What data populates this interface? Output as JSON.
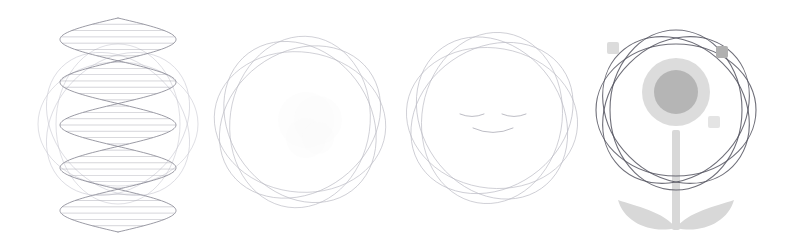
{
  "page": {
    "background_color": "#ffffff",
    "width": 785,
    "height": 248,
    "style": "minimal line-art, light gray strokes on white"
  },
  "palette": {
    "orbit_light": "#b9b9c2",
    "orbit_faint": "#c9c9d2",
    "orbit_dark": "#555560",
    "helix_stroke": "#8a8a95",
    "rung_stroke": "#a8a8b2",
    "face_stroke": "#b0b0ba",
    "nucleus_outer": "#dcdcdc",
    "nucleus_inner": "#b5b5b5",
    "electron_light": "#dcdcdc",
    "electron_dark": "#b0b0b0",
    "electron_faint": "#e4e4e4",
    "stem_fill": "#d8d8d8",
    "leaf_fill": "#d8d8d8",
    "ghost_fill": "#fbfbfb"
  },
  "figures": [
    {
      "index": 1,
      "name": "dna-double-helix",
      "label": "DNA Double Helix with Orbital Rings",
      "x": 8,
      "width": 195,
      "center_x": 118,
      "center_y": 124,
      "description": "Vertical DNA double helix drawn as two sine-wave strands with horizontal base-pair rungs, overlaid on a set of rotated elliptical orbit rings",
      "helix": {
        "cycles": 2.5,
        "amplitude": 58,
        "top": 18,
        "bottom": 232,
        "stroke_width": 0.9,
        "rung_count": 34,
        "rung_stroke_width": 0.6
      },
      "orbits": {
        "count": 4,
        "rx": 80,
        "ry": 62,
        "rotations": [
          0,
          45,
          90,
          135
        ],
        "stroke_width": 0.7
      }
    },
    {
      "index": 2,
      "name": "plain-orbit-rosette",
      "label": "Plain Orbital Rosette",
      "x": 205,
      "width": 190,
      "center_x": 300,
      "center_y": 122,
      "description": "Four rotated ellipses forming a rosette; a very faint ghost shape sits at the center",
      "orbits": {
        "count": 4,
        "rx": 86,
        "ry": 70,
        "rotations": [
          8,
          53,
          98,
          143
        ],
        "stroke_width": 0.7
      },
      "ghost": {
        "present": true,
        "cx": 312,
        "cy": 128,
        "r": 28,
        "opacity": 0.45
      }
    },
    {
      "index": 3,
      "name": "smiling-face-rosette",
      "label": "Smiling Face Orbital Rosette",
      "x": 398,
      "width": 190,
      "center_x": 492,
      "center_y": 118,
      "description": "Four rotated ellipses forming a rosette with a simple smiling face drawn inside: two closed curved eyes and an upward-curving mouth",
      "orbits": {
        "count": 4,
        "rx": 86,
        "ry": 70,
        "rotations": [
          10,
          55,
          100,
          145
        ],
        "stroke_width": 0.7
      },
      "face": {
        "eye_left_cx": 472,
        "eye_right_cx": 514,
        "eye_cy": 114,
        "eye_half_width": 12,
        "eye_dip": 5,
        "mouth_cx": 493,
        "mouth_cy": 128,
        "mouth_half_width": 20,
        "mouth_dip": 9,
        "stroke_width": 0.9
      }
    },
    {
      "index": 4,
      "name": "atom-flower",
      "label": "Atom Flower",
      "x": 590,
      "width": 195,
      "center_x": 676,
      "center_y": 110,
      "description": "Atom with dark elliptical orbits, a shaded nucleus, three electron dots on the orbits, and a flower stem with two leaves below",
      "orbits": {
        "count": 4,
        "rx": 80,
        "ry": 66,
        "rotations": [
          0,
          45,
          90,
          135
        ],
        "stroke_width": 1.1
      },
      "nucleus": {
        "cx": 676,
        "cy": 92,
        "outer_r": 34,
        "inner_r": 22
      },
      "electrons": [
        {
          "name": "electron-upper-left",
          "cx": 613,
          "cy": 48,
          "r": 6,
          "tone": "light"
        },
        {
          "name": "electron-upper-right",
          "cx": 722,
          "cy": 52,
          "r": 6,
          "tone": "dark"
        },
        {
          "name": "electron-lower-right",
          "cx": 714,
          "cy": 122,
          "r": 6,
          "tone": "faint"
        }
      ],
      "stem": {
        "x": 672,
        "y_top": 130,
        "width": 8,
        "y_bottom": 230
      },
      "leaves": [
        {
          "name": "leaf-left",
          "side": "left"
        },
        {
          "name": "leaf-right",
          "side": "right"
        }
      ]
    }
  ]
}
